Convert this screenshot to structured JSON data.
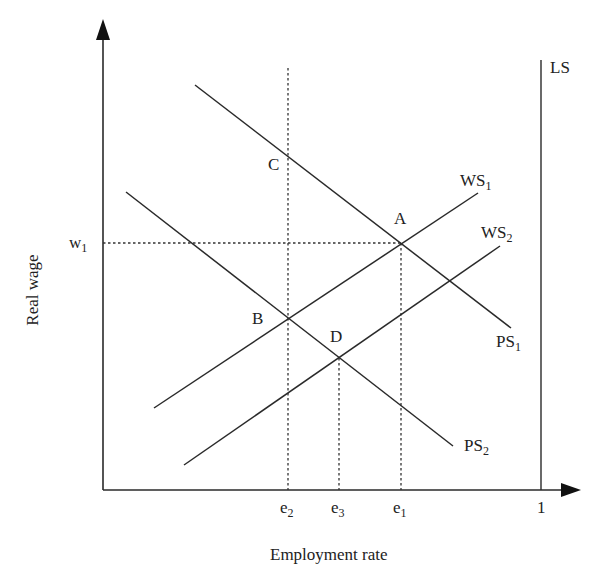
{
  "axes": {
    "x_label": "Employment rate",
    "y_label": "Real wage",
    "x_ticks": [
      {
        "base": "e",
        "sub": "2"
      },
      {
        "base": "e",
        "sub": "3"
      },
      {
        "base": "e",
        "sub": "1"
      },
      {
        "base": "1",
        "sub": ""
      }
    ],
    "y_ticks": [
      {
        "base": "w",
        "sub": "1"
      }
    ]
  },
  "curves": [
    {
      "base": "WS",
      "sub": "1",
      "kind": "wage-setting"
    },
    {
      "base": "WS",
      "sub": "2",
      "kind": "wage-setting"
    },
    {
      "base": "PS",
      "sub": "1",
      "kind": "price-setting"
    },
    {
      "base": "PS",
      "sub": "2",
      "kind": "price-setting"
    },
    {
      "base": "LS",
      "sub": "",
      "kind": "labour-supply"
    }
  ],
  "points": [
    "A",
    "B",
    "C",
    "D"
  ],
  "colors": {
    "line": "#2a2a2a",
    "background": "#ffffff"
  }
}
